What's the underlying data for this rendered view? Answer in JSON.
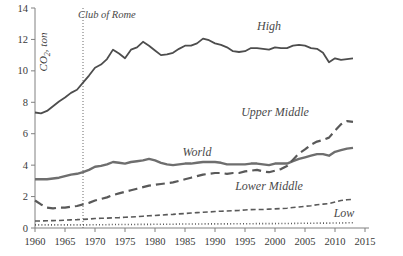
{
  "chart_data": {
    "type": "line",
    "title": "",
    "xlabel": "",
    "ylabel": "CO2, ton",
    "ylabel_display": "CO₂, ton",
    "xlim": [
      1960,
      2015
    ],
    "ylim": [
      0,
      14
    ],
    "grid": false,
    "legend_position": "inline-labels",
    "y_ticks": [
      0,
      2,
      4,
      6,
      8,
      10,
      12,
      14
    ],
    "x_ticks": [
      1960,
      1965,
      1970,
      1975,
      1980,
      1985,
      1990,
      1995,
      2000,
      2005,
      2010,
      2015
    ],
    "x": [
      1960,
      1961,
      1962,
      1963,
      1964,
      1965,
      1966,
      1967,
      1968,
      1969,
      1970,
      1971,
      1972,
      1973,
      1974,
      1975,
      1976,
      1977,
      1978,
      1979,
      1980,
      1981,
      1982,
      1983,
      1984,
      1985,
      1986,
      1987,
      1988,
      1989,
      1990,
      1991,
      1992,
      1993,
      1994,
      1995,
      1996,
      1997,
      1998,
      1999,
      2000,
      2001,
      2002,
      2003,
      2004,
      2005,
      2006,
      2007,
      2008,
      2009,
      2010,
      2011,
      2012,
      2013
    ],
    "annotations": [
      {
        "text": "Club of Rome",
        "x": 1968,
        "line": "vertical-dotted",
        "y_top": 14,
        "y_bottom": 0
      }
    ],
    "series": [
      {
        "name": "High",
        "label": "High",
        "style": "solid",
        "color": "#4d4d4d",
        "width": 1.8,
        "label_x": 1999,
        "label_y": 12.6,
        "values": [
          7.35,
          7.3,
          7.45,
          7.75,
          8.05,
          8.3,
          8.6,
          8.8,
          9.25,
          9.7,
          10.2,
          10.4,
          10.75,
          11.35,
          11.1,
          10.8,
          11.35,
          11.5,
          11.85,
          11.6,
          11.3,
          11.0,
          11.05,
          11.15,
          11.4,
          11.6,
          11.6,
          11.75,
          12.05,
          11.95,
          11.75,
          11.65,
          11.5,
          11.25,
          11.2,
          11.25,
          11.45,
          11.45,
          11.4,
          11.35,
          11.5,
          11.45,
          11.45,
          11.6,
          11.65,
          11.6,
          11.45,
          11.4,
          11.15,
          10.55,
          10.8,
          10.7,
          10.75,
          10.8
        ]
      },
      {
        "name": "World",
        "label": "World",
        "style": "solid",
        "color": "#6e6e6e",
        "width": 2.4,
        "label_x": 1987,
        "label_y": 4.6,
        "values": [
          3.1,
          3.1,
          3.1,
          3.15,
          3.2,
          3.3,
          3.4,
          3.45,
          3.55,
          3.7,
          3.9,
          3.95,
          4.05,
          4.2,
          4.15,
          4.1,
          4.2,
          4.25,
          4.3,
          4.4,
          4.3,
          4.15,
          4.05,
          4.0,
          4.05,
          4.1,
          4.1,
          4.15,
          4.2,
          4.2,
          4.2,
          4.15,
          4.05,
          4.05,
          4.05,
          4.05,
          4.1,
          4.1,
          4.05,
          4.0,
          4.1,
          4.1,
          4.1,
          4.25,
          4.4,
          4.5,
          4.6,
          4.7,
          4.7,
          4.6,
          4.85,
          4.95,
          5.05,
          5.1
        ]
      },
      {
        "name": "Upper Middle",
        "label": "Upper Middle",
        "style": "long-dash",
        "color": "#595959",
        "width": 2.2,
        "label_x": 2000,
        "label_y": 7.1,
        "values": [
          1.75,
          1.5,
          1.3,
          1.25,
          1.3,
          1.3,
          1.35,
          1.4,
          1.5,
          1.6,
          1.75,
          1.85,
          1.95,
          2.1,
          2.2,
          2.3,
          2.4,
          2.5,
          2.6,
          2.7,
          2.75,
          2.8,
          2.85,
          2.9,
          3.0,
          3.1,
          3.2,
          3.3,
          3.4,
          3.45,
          3.5,
          3.5,
          3.45,
          3.5,
          3.5,
          3.6,
          3.65,
          3.7,
          3.6,
          3.55,
          3.65,
          3.75,
          3.95,
          4.35,
          4.75,
          5.0,
          5.3,
          5.5,
          5.6,
          5.75,
          6.2,
          6.6,
          6.8,
          6.75
        ]
      },
      {
        "name": "Lower Middle",
        "label": "Lower Middle",
        "style": "short-dash",
        "color": "#595959",
        "width": 1.6,
        "label_x": 1999,
        "label_y": 2.45,
        "values": [
          0.45,
          0.45,
          0.46,
          0.47,
          0.48,
          0.5,
          0.52,
          0.53,
          0.55,
          0.57,
          0.6,
          0.62,
          0.63,
          0.65,
          0.66,
          0.68,
          0.7,
          0.72,
          0.75,
          0.78,
          0.8,
          0.82,
          0.85,
          0.87,
          0.9,
          0.92,
          0.95,
          0.98,
          1.0,
          1.02,
          1.05,
          1.07,
          1.08,
          1.1,
          1.12,
          1.15,
          1.17,
          1.18,
          1.18,
          1.2,
          1.22,
          1.24,
          1.26,
          1.3,
          1.34,
          1.38,
          1.42,
          1.48,
          1.52,
          1.55,
          1.65,
          1.75,
          1.8,
          1.82
        ]
      },
      {
        "name": "Low",
        "label": "Low",
        "style": "dotted",
        "color": "#595959",
        "width": 1.6,
        "label_x": 2011.5,
        "label_y": 0.72,
        "values": [
          0.2,
          0.2,
          0.2,
          0.2,
          0.2,
          0.2,
          0.2,
          0.2,
          0.2,
          0.2,
          0.21,
          0.21,
          0.21,
          0.22,
          0.22,
          0.22,
          0.22,
          0.23,
          0.23,
          0.23,
          0.24,
          0.24,
          0.24,
          0.24,
          0.25,
          0.25,
          0.25,
          0.25,
          0.26,
          0.26,
          0.26,
          0.26,
          0.26,
          0.27,
          0.27,
          0.27,
          0.27,
          0.28,
          0.28,
          0.28,
          0.28,
          0.29,
          0.29,
          0.29,
          0.3,
          0.3,
          0.3,
          0.31,
          0.31,
          0.31,
          0.32,
          0.32,
          0.33,
          0.33
        ]
      }
    ]
  }
}
